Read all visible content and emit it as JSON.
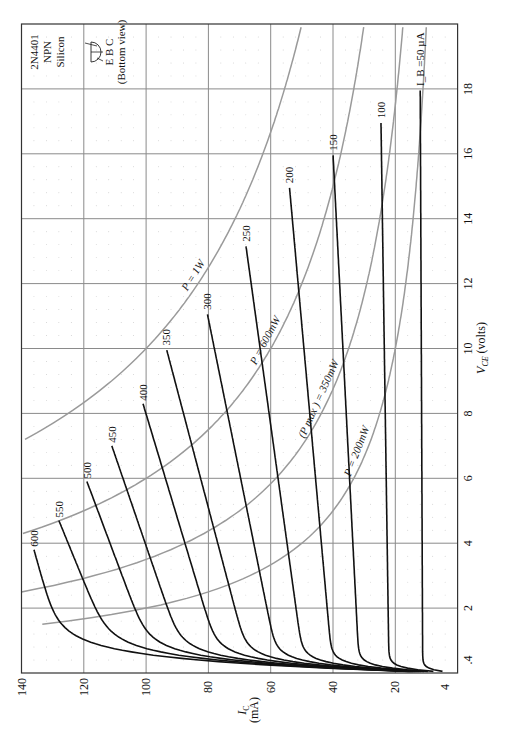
{
  "chart_data": {
    "type": "line",
    "title": "",
    "device": {
      "part": "2N4401",
      "polarity": "NPN",
      "material": "Silicon",
      "pinout": "E B C",
      "pinout_note": "(Bottom view)"
    },
    "xlabel": "V_CE (volts)",
    "ylabel": "I_C (mA)",
    "xlim": [
      0,
      20
    ],
    "ylim": [
      0,
      140
    ],
    "x_ticks": [
      ".4",
      "2",
      "4",
      "6",
      "8",
      "10",
      "12",
      "14",
      "16",
      "18"
    ],
    "x_tick_values": [
      0.4,
      2,
      4,
      6,
      8,
      10,
      12,
      14,
      16,
      18
    ],
    "y_ticks": [
      "4",
      "20",
      "40",
      "60",
      "80",
      "100",
      "120",
      "140"
    ],
    "y_tick_values": [
      4,
      20,
      40,
      60,
      80,
      100,
      120,
      140
    ],
    "grid": true,
    "orientation": "rotated-90-ccw",
    "series": [
      {
        "name": "I_B = 50 µA",
        "label": "I_B =50 µA",
        "ib": 50,
        "sat": 11.2,
        "end": [
          18,
          12
        ]
      },
      {
        "name": "100",
        "label": "100",
        "ib": 100,
        "sat": 22,
        "end": [
          17,
          24.6
        ]
      },
      {
        "name": "150",
        "label": "150",
        "ib": 150,
        "sat": 31.5,
        "end": [
          16,
          40
        ]
      },
      {
        "name": "200",
        "label": "200",
        "ib": 200,
        "sat": 40,
        "end": [
          15,
          54
        ]
      },
      {
        "name": "250",
        "label": "250",
        "ib": 250,
        "sat": 49,
        "end": [
          13.2,
          68
        ]
      },
      {
        "name": "300",
        "label": "300",
        "ib": 300,
        "sat": 57,
        "end": [
          11.1,
          80.4
        ]
      },
      {
        "name": "350",
        "label": "350",
        "ib": 350,
        "sat": 66,
        "end": [
          10,
          93.5
        ]
      },
      {
        "name": "400",
        "label": "400",
        "ib": 400,
        "sat": 75,
        "end": [
          8.3,
          101
        ]
      },
      {
        "name": "450",
        "label": "450",
        "ib": 450,
        "sat": 86,
        "end": [
          7.0,
          111
        ]
      },
      {
        "name": "500",
        "label": "500",
        "ib": 500,
        "sat": 96,
        "end": [
          5.9,
          119
        ]
      },
      {
        "name": "550",
        "label": "550",
        "ib": 550,
        "sat": 108,
        "end": [
          4.7,
          128
        ]
      },
      {
        "name": "600",
        "label": "600",
        "ib": 600,
        "sat": 125,
        "end": [
          3.8,
          136
        ]
      }
    ],
    "power_curves": [
      {
        "name": "P = 200mW",
        "label": "P = 200mW",
        "watts": 0.2
      },
      {
        "name": "(P_max) = 350mW",
        "label": "(P max ) = 350mW",
        "watts": 0.35
      },
      {
        "name": "P = 600mW",
        "label": "P = 600mW",
        "watts": 0.6
      },
      {
        "name": "P = 1W",
        "label": "P = 1W",
        "watts": 1.0
      }
    ]
  }
}
